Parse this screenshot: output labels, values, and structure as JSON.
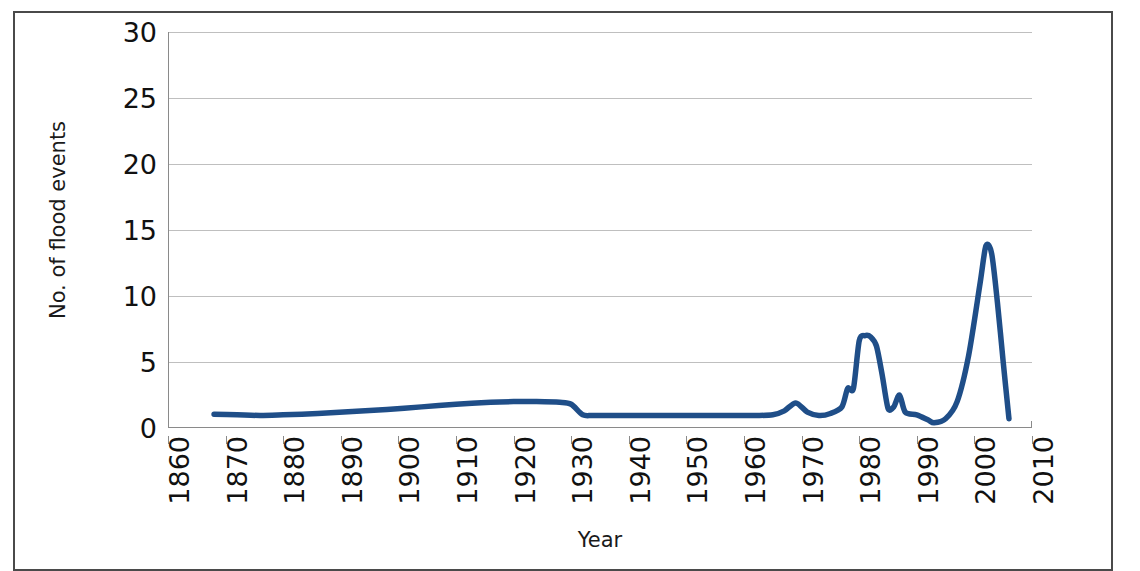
{
  "chart_data": {
    "type": "line",
    "title": "",
    "xlabel": "Year",
    "ylabel": "No. of flood events",
    "xlim": [
      1860,
      2010
    ],
    "ylim": [
      0,
      30
    ],
    "grid": true,
    "legend": "none",
    "xticks": [
      "1860",
      "1870",
      "1880",
      "1890",
      "1900",
      "1910",
      "1920",
      "1930",
      "1940",
      "1950",
      "1960",
      "1970",
      "1980",
      "1990",
      "2000",
      "2010"
    ],
    "yticks": [
      "0",
      "5",
      "10",
      "15",
      "20",
      "25",
      "30"
    ],
    "line_color": "#1F4E88",
    "series": [
      {
        "name": "No. of flood events",
        "x": [
          1868,
          1872,
          1876,
          1880,
          1886,
          1892,
          1898,
          1904,
          1910,
          1916,
          1920,
          1924,
          1928,
          1930,
          1932,
          1934,
          1940,
          1948,
          1956,
          1962,
          1965,
          1967,
          1969,
          1971,
          1973,
          1975,
          1977,
          1978,
          1979,
          1980,
          1981,
          1982,
          1983,
          1984,
          1985,
          1986,
          1987,
          1988,
          1990,
          1992,
          1993,
          1995,
          1997,
          1999,
          2001,
          2002,
          2003,
          2004,
          2005,
          2006
        ],
        "values": [
          1.05,
          1.0,
          0.95,
          1.0,
          1.1,
          1.25,
          1.4,
          1.6,
          1.8,
          1.95,
          2.0,
          2.0,
          1.95,
          1.8,
          1.0,
          0.95,
          0.95,
          0.95,
          0.95,
          0.95,
          1.0,
          1.3,
          1.9,
          1.2,
          0.95,
          1.1,
          1.6,
          3.0,
          3.0,
          6.6,
          7.0,
          6.9,
          6.2,
          4.0,
          1.5,
          1.6,
          2.5,
          1.2,
          1.0,
          0.6,
          0.4,
          0.7,
          2.0,
          5.5,
          11.0,
          13.8,
          13.2,
          9.5,
          5.0,
          0.7
        ]
      }
    ]
  }
}
